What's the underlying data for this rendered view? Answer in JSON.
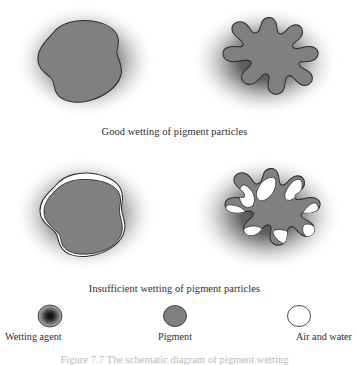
{
  "figure": {
    "background_color": "#ffffff",
    "pigment_color": "#808080",
    "pigment_stroke_color": "#2e2e2e",
    "wetting_agent_color": "#1c1c1c",
    "air_and_water_color": "#ffffff",
    "text_color": "#2c2c2c"
  },
  "panels": [
    {
      "id": "good-round",
      "row_label": "Good wetting of pigment particles",
      "particle_shape": "rounded-blob",
      "wetting": "complete",
      "has_voids": false
    },
    {
      "id": "good-star",
      "row_label": "Good wetting of pigment particles",
      "particle_shape": "lobed-star-blob",
      "wetting": "complete",
      "has_voids": false
    },
    {
      "id": "poor-round",
      "row_label": "Insufficient wetting of pigment particles",
      "particle_shape": "rounded-blob",
      "wetting": "insufficient",
      "has_voids": true
    },
    {
      "id": "poor-star",
      "row_label": "Insufficient wetting of pigment particles",
      "particle_shape": "lobed-star-blob",
      "wetting": "insufficient",
      "has_voids": true
    }
  ],
  "captions": {
    "good": "Good wetting of pigment particles",
    "insufficient": "Insufficient wetting of pigment particles"
  },
  "legend": {
    "items": [
      {
        "label": "Wetting agent",
        "icon": "radial-dark-circle-icon",
        "color": "#1c1c1c"
      },
      {
        "label": "Pigment",
        "icon": "gray-filled-circle-icon",
        "color": "#808080"
      },
      {
        "label": "Air and water",
        "icon": "white-outline-circle-icon",
        "color": "#ffffff"
      }
    ]
  },
  "figure_caption": {
    "text": "Figure 7.7   The schematic diagram of pigment wetting",
    "clipped": true
  }
}
